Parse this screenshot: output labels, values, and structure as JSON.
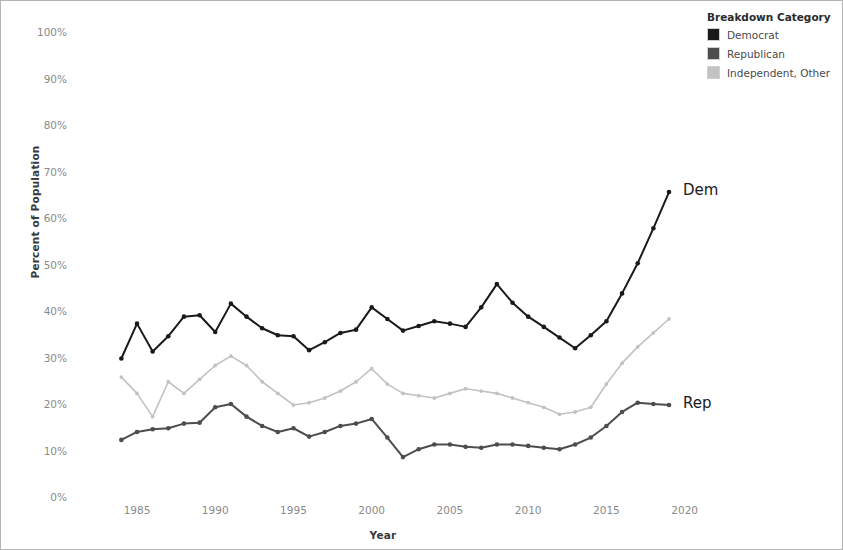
{
  "chart_data": {
    "type": "line",
    "title": "",
    "xlabel": "Year",
    "ylabel": "Percent of Population",
    "xlim": [
      1983,
      2021
    ],
    "ylim": [
      0,
      100
    ],
    "grid": false,
    "legend_position": "top-right",
    "legend_title": "Breakdown Category",
    "x": [
      1984,
      1985,
      1986,
      1987,
      1988,
      1989,
      1990,
      1991,
      1992,
      1993,
      1994,
      1995,
      1996,
      1997,
      1998,
      1999,
      2000,
      2001,
      2002,
      2003,
      2004,
      2005,
      2006,
      2007,
      2008,
      2009,
      2010,
      2011,
      2012,
      2013,
      2014,
      2015,
      2016,
      2017,
      2018,
      2019
    ],
    "series": [
      {
        "name": "Democrat",
        "color": "#1a1a1a",
        "values": [
          30.0,
          37.5,
          31.5,
          34.8,
          39.0,
          39.3,
          35.7,
          41.8,
          39.0,
          36.5,
          35.0,
          34.8,
          31.8,
          33.5,
          35.5,
          36.2,
          41.0,
          38.5,
          36.0,
          37.0,
          38.0,
          37.5,
          36.8,
          41.0,
          46.0,
          42.0,
          39.0,
          36.8,
          34.5,
          32.2,
          35.0,
          38.0,
          44.0,
          50.5,
          58.0,
          65.8
        ]
      },
      {
        "name": "Republican",
        "color": "#4d4d4d",
        "values": [
          12.5,
          14.2,
          14.8,
          15.0,
          16.0,
          16.2,
          19.5,
          20.2,
          17.5,
          15.5,
          14.2,
          15.0,
          13.2,
          14.2,
          15.5,
          16.0,
          17.0,
          13.0,
          8.8,
          10.5,
          11.5,
          11.5,
          11.0,
          10.8,
          11.5,
          11.5,
          11.2,
          10.8,
          10.5,
          11.5,
          13.0,
          15.5,
          18.5,
          20.5,
          20.2,
          20.0
        ]
      },
      {
        "name": "Independent, Other",
        "color": "#c2c2c2",
        "values": [
          26.0,
          22.5,
          17.5,
          25.0,
          22.5,
          25.5,
          28.5,
          30.5,
          28.5,
          25.0,
          22.5,
          20.0,
          20.5,
          21.5,
          23.0,
          25.0,
          27.8,
          24.5,
          22.5,
          22.0,
          21.5,
          22.5,
          23.5,
          23.0,
          22.5,
          21.5,
          20.5,
          19.5,
          18.0,
          18.5,
          19.5,
          24.5,
          29.0,
          32.5,
          35.5,
          38.5
        ]
      }
    ],
    "xticks": [
      1985,
      1990,
      1995,
      2000,
      2005,
      2010,
      2015,
      2020
    ],
    "xtick_labels": [
      "1985",
      "1990",
      "1995",
      "2000",
      "2005",
      "2010",
      "2015",
      "2020"
    ],
    "yticks": [
      0,
      10,
      20,
      30,
      40,
      50,
      60,
      70,
      80,
      90,
      100
    ],
    "ytick_labels": [
      "0%",
      "10%",
      "20%",
      "30%",
      "40%",
      "50%",
      "60%",
      "70%",
      "80%",
      "90%",
      "100%"
    ],
    "annotations": [
      {
        "text": "Dem",
        "x": 2019,
        "y": 65.8
      },
      {
        "text": "Rep",
        "x": 2019,
        "y": 20.0
      }
    ]
  }
}
